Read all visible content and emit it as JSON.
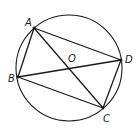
{
  "diagram": {
    "type": "geometry",
    "circle": {
      "center_label": "O",
      "cx": 69,
      "cy": 68,
      "r": 53
    },
    "points": {
      "A": {
        "label": "A",
        "x": 34,
        "y": 28
      },
      "B": {
        "label": "B",
        "x": 18,
        "y": 77
      },
      "C": {
        "label": "C",
        "x": 103,
        "y": 108
      },
      "D": {
        "label": "D",
        "x": 121,
        "y": 60
      }
    },
    "labels": {
      "A": "A",
      "B": "B",
      "C": "C",
      "D": "D",
      "O": "O"
    },
    "segments": [
      "AB",
      "BC",
      "CD",
      "DA",
      "AC",
      "BD"
    ]
  }
}
